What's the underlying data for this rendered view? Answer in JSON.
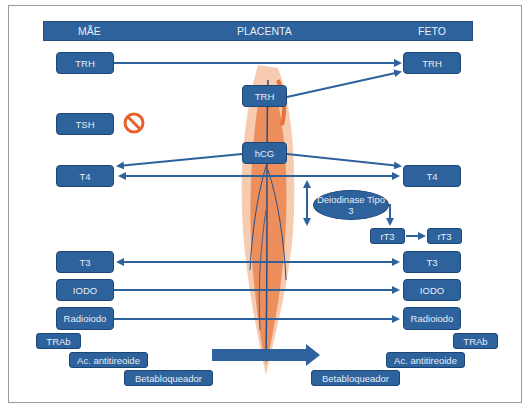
{
  "header": {
    "left": "MÃE",
    "center": "PLACENTA",
    "right": "FETO"
  },
  "colors": {
    "box": "#2d629c",
    "arrow": "#2d629c",
    "prohibit": "#e8602c",
    "placenta_orange": "#e8733a",
    "placenta_vessel": "#2b4f86"
  },
  "nodes": {
    "mae_trh": "TRH",
    "feto_trh": "TRH",
    "placenta_trh": "TRH",
    "mae_tsh": "TSH",
    "hcg": "hCG",
    "mae_t4": "T4",
    "feto_t4": "T4",
    "deiodinase": "Deiodinase Tipo 3",
    "rt3_left": "rT3",
    "rt3_right": "rT3",
    "mae_t3": "T3",
    "feto_t3": "T3",
    "mae_iodo": "IODO",
    "feto_iodo": "IODO",
    "mae_radioiodo": "Radioiodo",
    "feto_radioiodo": "Radioiodo",
    "mae_trab": "TRAb",
    "feto_trab": "TRAb",
    "mae_ac": "Ac. antitireoide",
    "feto_ac": "Ac. antitireoide",
    "mae_beta": "Betabloqueador",
    "feto_beta": "Betabloqueador"
  },
  "icons": {
    "prohibit": "prohibited-icon"
  }
}
